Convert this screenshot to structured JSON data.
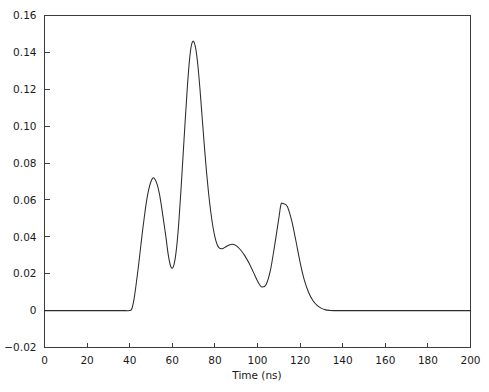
{
  "chart_data": {
    "type": "line",
    "title": "",
    "subtitle": "",
    "xlabel": "Time (ns)",
    "ylabel": "",
    "xlim": [
      0,
      200
    ],
    "ylim": [
      -0.02,
      0.16
    ],
    "grid": false,
    "legend": null,
    "legend_position": "none",
    "line_color": "#2b2b2b",
    "axis_color": "#3c3c3c",
    "background_color": "#ffffff",
    "xticks": [
      0,
      20,
      40,
      60,
      80,
      100,
      120,
      140,
      160,
      180,
      200
    ],
    "xtick_labels": [
      "0",
      "20",
      "40",
      "60",
      "80",
      "100",
      "120",
      "140",
      "160",
      "180",
      "200"
    ],
    "yticks": [
      -0.02,
      0,
      0.02,
      0.04,
      0.06,
      0.08,
      0.1,
      0.12,
      0.14,
      0.16
    ],
    "ytick_labels": [
      "−0.02",
      "0",
      "0.02",
      "0.04",
      "0.06",
      "0.08",
      "0.10",
      "0.12",
      "0.14",
      "0.16"
    ],
    "annotations": [],
    "series": [
      {
        "name": "signal",
        "x": [
          0,
          5,
          10,
          15,
          20,
          25,
          30,
          35,
          38,
          40,
          41,
          42,
          43,
          44,
          45,
          46,
          47,
          48,
          49,
          50,
          51,
          52,
          53,
          54,
          55,
          56,
          57,
          58,
          59,
          60,
          61,
          62,
          63,
          64,
          65,
          66,
          67,
          68,
          69,
          70,
          71,
          72,
          73,
          74,
          75,
          76,
          77,
          78,
          79,
          80,
          81,
          82,
          83,
          84,
          85,
          86,
          87,
          88,
          89,
          90,
          92,
          94,
          96,
          98,
          100,
          101,
          102,
          104,
          106,
          108,
          110,
          111,
          112,
          114,
          116,
          118,
          120,
          122,
          124,
          126,
          128,
          130,
          132,
          134,
          136,
          140,
          150,
          160,
          170,
          180,
          190,
          200
        ],
        "y": [
          0.0,
          0.0,
          0.0,
          0.0,
          0.0,
          0.0,
          0.0,
          0.0,
          0.0,
          0.0,
          0.001,
          0.006,
          0.014,
          0.023,
          0.033,
          0.043,
          0.052,
          0.06,
          0.066,
          0.07,
          0.072,
          0.071,
          0.068,
          0.063,
          0.056,
          0.048,
          0.04,
          0.031,
          0.025,
          0.023,
          0.026,
          0.034,
          0.047,
          0.064,
          0.083,
          0.102,
          0.12,
          0.135,
          0.144,
          0.146,
          0.142,
          0.133,
          0.12,
          0.105,
          0.09,
          0.076,
          0.064,
          0.054,
          0.046,
          0.04,
          0.036,
          0.034,
          0.0335,
          0.0338,
          0.0345,
          0.0352,
          0.0357,
          0.036,
          0.0358,
          0.0352,
          0.033,
          0.0298,
          0.0258,
          0.021,
          0.016,
          0.014,
          0.0128,
          0.014,
          0.0215,
          0.035,
          0.05,
          0.0575,
          0.058,
          0.0565,
          0.049,
          0.038,
          0.0262,
          0.0165,
          0.0098,
          0.0055,
          0.0028,
          0.0012,
          0.0004,
          0.0001,
          0.0,
          0.0,
          0.0,
          0.0,
          0.0,
          0.0,
          0.0,
          0.0
        ]
      }
    ],
    "features": {
      "baseline_start_ns": 41,
      "baseline_end_ns": 131,
      "peaks": [
        {
          "label": "peak-1",
          "x": 51,
          "y": 0.072
        },
        {
          "label": "peak-2",
          "x": 70,
          "y": 0.146
        },
        {
          "label": "peak-3",
          "x": 88,
          "y": 0.036
        },
        {
          "label": "peak-4",
          "x": 111,
          "y": 0.058
        }
      ],
      "valleys": [
        {
          "label": "valley-1",
          "x": 59,
          "y": 0.023
        },
        {
          "label": "valley-2",
          "x": 83,
          "y": 0.0335
        },
        {
          "label": "valley-3",
          "x": 102,
          "y": 0.0128
        }
      ]
    }
  }
}
